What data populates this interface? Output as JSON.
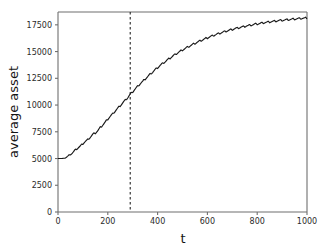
{
  "chart_data": {
    "type": "line",
    "title": "",
    "xlabel": "t",
    "ylabel": "average asset",
    "xlim": [
      0,
      1000
    ],
    "ylim": [
      0,
      18700
    ],
    "grid": false,
    "legend": null,
    "xticks": [
      0,
      200,
      400,
      600,
      800,
      1000
    ],
    "xtick_labels": [
      "0",
      "200",
      "400",
      "600",
      "800",
      "1000"
    ],
    "yticks": [
      0,
      2500,
      5000,
      7500,
      10000,
      12500,
      15000,
      17500
    ],
    "ytick_labels": [
      "0",
      "2500",
      "5000",
      "7500",
      "10000",
      "12500",
      "15000",
      "17500"
    ],
    "line_color": "#1a1a1a",
    "annotations": [
      {
        "name": "vertical-reference-line",
        "type": "vline",
        "x": 290,
        "style": "dashed",
        "color": "#1a1a1a"
      }
    ],
    "series": [
      {
        "name": "average asset",
        "description": "saturating growth with periodic sawtooth ripple",
        "x": [
          0,
          10,
          20,
          30,
          40,
          50,
          60,
          70,
          80,
          90,
          100,
          110,
          120,
          130,
          140,
          150,
          160,
          170,
          180,
          190,
          200,
          210,
          220,
          230,
          240,
          250,
          260,
          270,
          280,
          290,
          300,
          310,
          320,
          330,
          340,
          350,
          360,
          370,
          380,
          390,
          400,
          410,
          420,
          430,
          440,
          450,
          460,
          470,
          480,
          490,
          500,
          510,
          520,
          530,
          540,
          550,
          560,
          570,
          580,
          590,
          600,
          610,
          620,
          630,
          640,
          650,
          660,
          670,
          680,
          690,
          700,
          710,
          720,
          730,
          740,
          750,
          760,
          770,
          780,
          790,
          800,
          810,
          820,
          830,
          840,
          850,
          860,
          870,
          880,
          890,
          900,
          910,
          920,
          930,
          940,
          950,
          960,
          970,
          980,
          990,
          1000
        ],
        "y": [
          5000,
          5000,
          5010,
          5060,
          5220,
          5400,
          5560,
          5810,
          6000,
          6150,
          6400,
          6600,
          6760,
          7010,
          7250,
          7400,
          7600,
          7900,
          8150,
          8400,
          8700,
          8950,
          9180,
          9450,
          9700,
          9950,
          10200,
          10450,
          10700,
          11000,
          11250,
          11500,
          11750,
          12000,
          12200,
          12450,
          12650,
          12880,
          13080,
          13300,
          13500,
          13700,
          13880,
          14050,
          14230,
          14400,
          14560,
          14720,
          14870,
          15010,
          15150,
          15280,
          15410,
          15530,
          15650,
          15770,
          15880,
          15990,
          16090,
          16190,
          16290,
          16380,
          16470,
          16560,
          16640,
          16720,
          16800,
          16870,
          16940,
          17010,
          17070,
          17140,
          17190,
          17250,
          17300,
          17360,
          17410,
          17460,
          17500,
          17550,
          17590,
          17630,
          17670,
          17710,
          17740,
          17780,
          17810,
          17840,
          17870,
          17900,
          17930,
          17950,
          17980,
          18000,
          18020,
          18050,
          18070,
          18090,
          18110,
          18120,
          18140
        ]
      }
    ]
  }
}
